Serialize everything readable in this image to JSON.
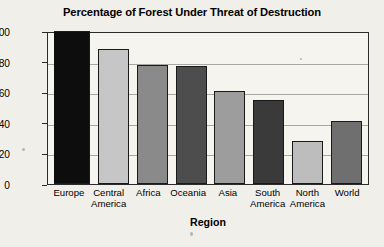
{
  "chart_data": {
    "type": "bar",
    "title": "Percentage of Forest Under Threat of Destruction",
    "xlabel": "Region",
    "ylabel": "Percent",
    "categories": [
      "Europe",
      "Central America",
      "Africa",
      "Oceania",
      "Asia",
      "South America",
      "North America",
      "World"
    ],
    "values": [
      100,
      88,
      78,
      77,
      61,
      55,
      28,
      41
    ],
    "ylim": [
      0,
      100
    ],
    "yticks": [
      0,
      20,
      40,
      60,
      80,
      100
    ],
    "grid": "horizontal",
    "legend": "none",
    "bar_colors": [
      "#0d0d0d",
      "#c6c6c6",
      "#8a8a8a",
      "#4d4d4d",
      "#9d9d9d",
      "#3a3a3a",
      "#bdbdbd",
      "#6f6f6f"
    ]
  },
  "axis": {
    "y_tick_labels": [
      "100",
      "80",
      "60",
      "40",
      "20",
      "0"
    ],
    "x_tick_labels": [
      "Europe",
      "Central\nAmerica",
      "Africa",
      "Oceania",
      "Asia",
      "South\nAmerica",
      "North\nAmerica",
      "World"
    ]
  }
}
